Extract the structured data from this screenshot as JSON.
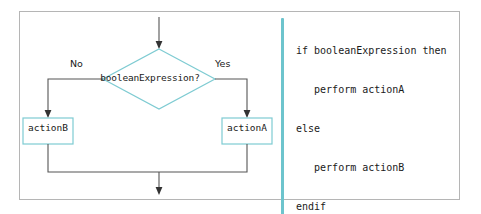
{
  "figure": {
    "kind": "flowchart-with-pseudocode",
    "accent_color": "#7ecbd2",
    "rule_color": "#6dc4cd",
    "frame_color": "#b5b5b5",
    "connector_color": "#555555",
    "background": "#ffffff"
  },
  "flowchart": {
    "decision": {
      "label": "booleanExpression?",
      "shape": "diamond"
    },
    "branches": {
      "false_label": "No",
      "true_label": "Yes"
    },
    "process_false": {
      "label": "actionB",
      "shape": "rectangle"
    },
    "process_true": {
      "label": "actionA",
      "shape": "rectangle"
    }
  },
  "pseudocode": {
    "lines": [
      "if booleanExpression then",
      "   perform actionA",
      "else",
      "   perform actionB",
      "endif"
    ]
  }
}
